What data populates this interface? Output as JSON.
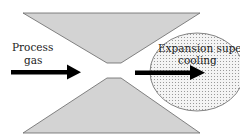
{
  "diagram": {
    "type": "nozzle-expansion-schematic",
    "labels": {
      "inlet_line1": "Process",
      "inlet_line2": "gas",
      "outlet_line1": "Expansion super",
      "outlet_line2": "cooling"
    },
    "colors": {
      "nozzle_fill": "#d3d3d3",
      "nozzle_stroke": "#555555",
      "circle_fill": "#f2f2f2",
      "circle_dots": "#8a8a8a",
      "arrow": "#000000"
    }
  }
}
